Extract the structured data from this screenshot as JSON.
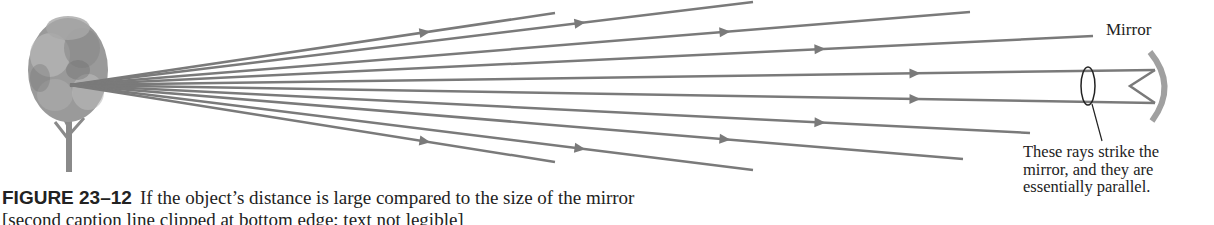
{
  "figure": {
    "labels": {
      "mirror": "Mirror",
      "annotation_lines": [
        "These rays strike the",
        "mirror, and they are",
        "essentially parallel."
      ]
    },
    "caption": {
      "number": "FIGURE 23–12",
      "line1": "If the object’s distance is large compared to the size of the mirror",
      "line2": "[second caption line clipped at bottom edge; text not legible]"
    },
    "colors": {
      "ray": "#7a7a7a",
      "mirror": "#a0a0a0",
      "ink": "#222222"
    },
    "rays": [
      {
        "x1": 70,
        "y1": 85,
        "x2": 555,
        "y2": 13,
        "arrow_x": 425
      },
      {
        "x1": 70,
        "y1": 85,
        "x2": 753,
        "y2": 2,
        "arrow_x": 580
      },
      {
        "x1": 70,
        "y1": 85,
        "x2": 970,
        "y2": 12,
        "arrow_x": 725
      },
      {
        "x1": 70,
        "y1": 85,
        "x2": 1093,
        "y2": 36,
        "arrow_x": 820
      },
      {
        "x1": 70,
        "y1": 85,
        "x2": 1155,
        "y2": 70,
        "arrow_x": 915
      },
      {
        "x1": 70,
        "y1": 85,
        "x2": 1155,
        "y2": 103,
        "arrow_x": 915
      },
      {
        "x1": 70,
        "y1": 85,
        "x2": 1030,
        "y2": 133,
        "arrow_x": 820
      },
      {
        "x1": 70,
        "y1": 85,
        "x2": 963,
        "y2": 159,
        "arrow_x": 725
      },
      {
        "x1": 70,
        "y1": 85,
        "x2": 753,
        "y2": 170,
        "arrow_x": 580
      },
      {
        "x1": 70,
        "y1": 85,
        "x2": 555,
        "y2": 162,
        "arrow_x": 425
      }
    ]
  }
}
